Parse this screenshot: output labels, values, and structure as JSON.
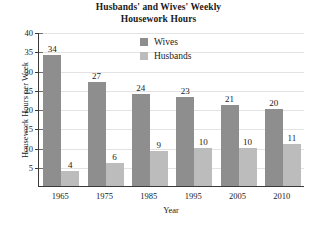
{
  "chart_data": {
    "type": "bar",
    "title": "Husbands' and Wives' Weekly Housework Hours",
    "title_lines": [
      "Husbands' and Wives' Weekly",
      "Housework Hours"
    ],
    "xlabel": "Year",
    "ylabel": "Housework Hours per Week",
    "categories": [
      "1965",
      "1975",
      "1985",
      "1995",
      "2005",
      "2010"
    ],
    "series": [
      {
        "name": "Wives",
        "color": "#8e8e8e",
        "values": [
          34,
          27,
          24,
          23,
          21,
          20
        ]
      },
      {
        "name": "Husbands",
        "color": "#bcbcbc",
        "values": [
          4,
          6,
          9,
          10,
          10,
          11
        ]
      }
    ],
    "ylim": [
      0,
      40
    ],
    "yticks": [
      5,
      10,
      15,
      20,
      25,
      30,
      35,
      40
    ],
    "grid": true,
    "legend_position": "top-right-inside",
    "data_labels": true
  }
}
